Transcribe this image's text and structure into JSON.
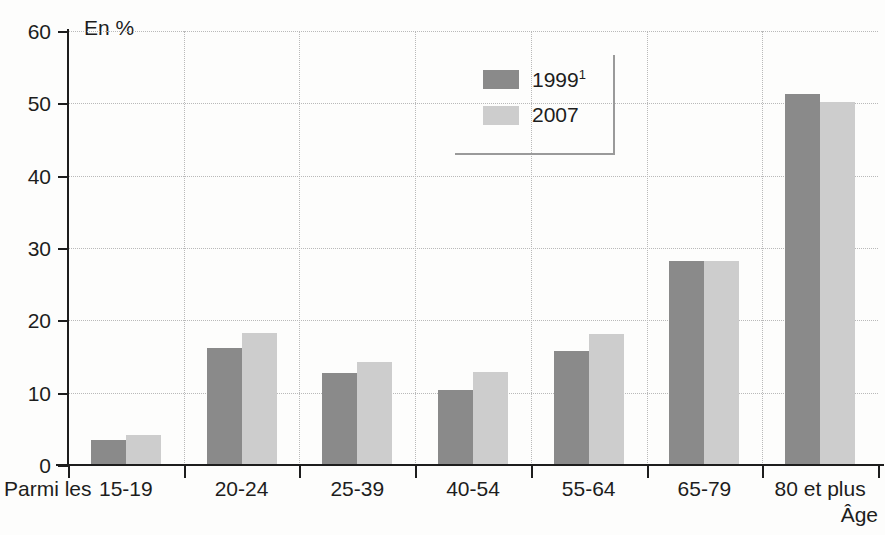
{
  "chart_data": {
    "type": "bar",
    "title": "",
    "xlabel": "Âge",
    "ylabel": "En %",
    "x_prefix_label": "Parmi les",
    "ylim": [
      0,
      60
    ],
    "yticks": [
      0,
      10,
      20,
      30,
      40,
      50,
      60
    ],
    "ytick_labels": [
      "0",
      "10",
      "20",
      "30",
      "40",
      "50",
      "60"
    ],
    "grid": true,
    "legend_position": "top-center",
    "categories": [
      "15-19",
      "20-24",
      "25-39",
      "40-54",
      "55-64",
      "65-79",
      "80 et plus"
    ],
    "series": [
      {
        "name": "1999",
        "footnote_marker": "1",
        "color": "#8a8a8a",
        "values": [
          3.5,
          16.2,
          12.7,
          10.4,
          15.8,
          28.2,
          51.3
        ]
      },
      {
        "name": "2007",
        "footnote_marker": "",
        "color": "#cdcdcd",
        "values": [
          4.2,
          18.3,
          14.2,
          12.9,
          18.1,
          28.2,
          50.2
        ]
      }
    ]
  },
  "colors": {
    "background": "#fdfdfc",
    "axis": "#1d1d1d",
    "grid": "#b9b9b9",
    "legend_border": "#9a9a9a",
    "series_1999": "#8a8a8a",
    "series_2007": "#cdcdcd"
  }
}
